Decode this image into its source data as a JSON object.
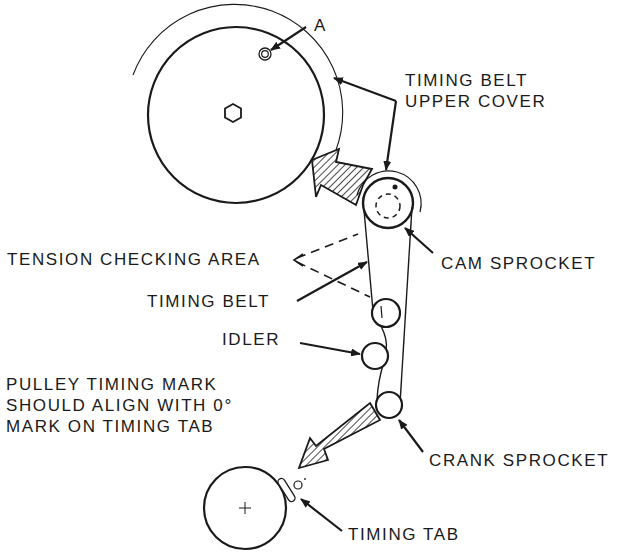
{
  "diagram": {
    "colors": {
      "ink": "#1a1a1a",
      "background": "#ffffff"
    },
    "labels": {
      "point_a": "A",
      "upper_cover_line1": "TIMING BELT",
      "upper_cover_line2": "UPPER COVER",
      "tension_area": "TENSION CHECKING AREA",
      "timing_belt": "TIMING BELT",
      "cam_sprocket": "CAM SPROCKET",
      "idler": "IDLER",
      "pulley_note_line1": "PULLEY TIMING MARK",
      "pulley_note_line2": "SHOULD ALIGN WITH 0°",
      "pulley_note_line3": "MARK ON TIMING TAB",
      "crank_sprocket": "CRANK SPROCKET",
      "timing_tab": "TIMING TAB"
    },
    "components": [
      {
        "id": "camshaft-pulley-large",
        "shape": "circle",
        "cx": 236,
        "cy": 115,
        "r": 88
      },
      {
        "id": "upper-cover-arc",
        "shape": "arc",
        "cx": 236,
        "cy": 115,
        "r": 106
      },
      {
        "id": "cam-sprocket",
        "shape": "circle",
        "cx": 388,
        "cy": 203,
        "r": 25
      },
      {
        "id": "upper-idler",
        "shape": "circle",
        "cx": 386,
        "cy": 313,
        "r": 14
      },
      {
        "id": "idler",
        "shape": "circle",
        "cx": 375,
        "cy": 356,
        "r": 13
      },
      {
        "id": "crank-sprocket",
        "shape": "circle",
        "cx": 389,
        "cy": 405,
        "r": 13
      },
      {
        "id": "crank-pulley",
        "shape": "circle",
        "cx": 245,
        "cy": 508,
        "r": 41
      }
    ]
  }
}
